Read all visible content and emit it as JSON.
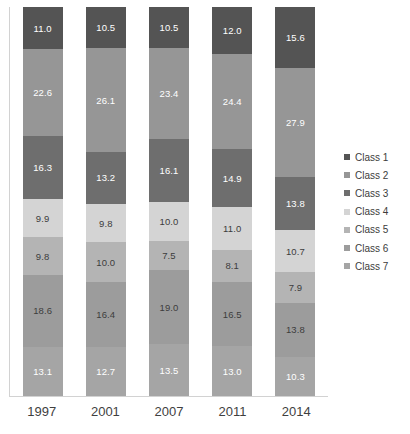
{
  "chart_data": {
    "type": "bar",
    "subtype": "stacked-percentage-column",
    "title": "",
    "xlabel": "",
    "ylabel": "",
    "ylim": [
      0,
      100
    ],
    "grid": false,
    "legend_position": "right",
    "categories": [
      "1997",
      "2001",
      "2007",
      "2011",
      "2014"
    ],
    "series": [
      {
        "name": "Class 1",
        "color": "#545454",
        "values": [
          11.0,
          10.5,
          10.5,
          12.0,
          15.6
        ]
      },
      {
        "name": "Class 2",
        "color": "#969696",
        "values": [
          22.6,
          26.1,
          23.4,
          24.4,
          27.9
        ]
      },
      {
        "name": "Class 3",
        "color": "#6e6e6e",
        "values": [
          16.3,
          13.2,
          16.1,
          14.9,
          13.8
        ]
      },
      {
        "name": "Class 4",
        "color": "#d4d4d4",
        "values": [
          9.9,
          9.8,
          10.0,
          11.0,
          10.7
        ]
      },
      {
        "name": "Class 5",
        "color": "#b4b4b4",
        "values": [
          9.8,
          10.0,
          7.5,
          8.1,
          7.9
        ]
      },
      {
        "name": "Class 6",
        "color": "#9c9c9c",
        "values": [
          18.6,
          16.4,
          19.0,
          16.5,
          13.8
        ]
      },
      {
        "name": "Class 7",
        "color": "#a5a5a5",
        "values": [
          13.1,
          12.7,
          13.5,
          13.0,
          10.3
        ]
      }
    ],
    "label_colors": {
      "Class 1": "#ffffff",
      "Class 2": "#ffffff",
      "Class 3": "#ffffff",
      "Class 4": "#3c3c3c",
      "Class 5": "#3c3c3c",
      "Class 6": "#3c3c3c",
      "Class 7": "#ffffff"
    },
    "label_format": "one-decimal"
  },
  "legend": {
    "items": [
      {
        "label": "Class 1"
      },
      {
        "label": "Class 2"
      },
      {
        "label": "Class 3"
      },
      {
        "label": "Class 4"
      },
      {
        "label": "Class 5"
      },
      {
        "label": "Class 6"
      },
      {
        "label": "Class 7"
      }
    ]
  },
  "axis": {
    "x_tick_labels": [
      "1997",
      "2001",
      "2007",
      "2011",
      "2014"
    ]
  },
  "title_strip": ""
}
